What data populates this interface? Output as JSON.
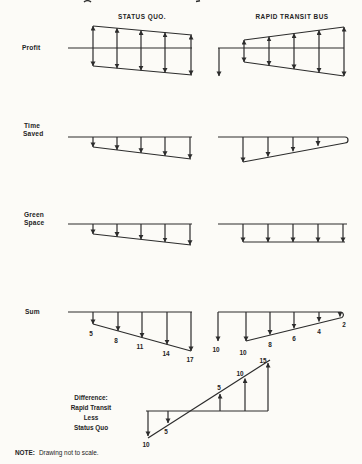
{
  "page": {
    "headers": {
      "status_quo": "STATUS QUO.",
      "rapid_transit": "RAPID TRANSIT BUS"
    },
    "row_labels": {
      "profit": "Profit",
      "time_saved": [
        "Time",
        "Saved"
      ],
      "green_space": [
        "Green",
        "Space"
      ],
      "sum": "Sum"
    },
    "sum_values": {
      "status_quo": [
        "5",
        "8",
        "11",
        "14",
        "17"
      ],
      "rapid_transit": [
        "10",
        "10",
        "8",
        "6",
        "4",
        "2"
      ]
    },
    "difference": {
      "label_lines": [
        "Difference:",
        "Rapid Transit",
        "Less",
        "Status Quo"
      ],
      "below_axis_values": [
        "10",
        "5"
      ],
      "above_axis_values": [
        "5",
        "10",
        "15"
      ]
    },
    "note": {
      "prefix": "NOTE:",
      "text": "Drawing not to scale."
    },
    "colors": {
      "ink": "#2c2c2c",
      "paper": "#fcfbf7"
    }
  }
}
